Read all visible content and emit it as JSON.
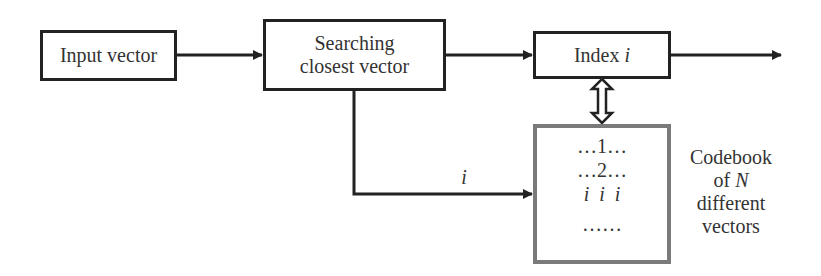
{
  "diagram": {
    "nodes": {
      "input": {
        "label": "Input vector"
      },
      "search": {
        "line1": "Searching",
        "line2": "closest vector"
      },
      "index": {
        "label": "Index",
        "var": "i"
      },
      "codebook": {
        "rows": [
          "…1…",
          "…2…",
          "i  i  i",
          "……"
        ]
      }
    },
    "labels": {
      "edge_i": "i",
      "codebook_caption": {
        "line1": "Codebook",
        "line2_prefix": "of ",
        "line2_var": "N",
        "line3": "different",
        "line4": "vectors"
      }
    },
    "edges": [
      {
        "from": "input",
        "to": "search"
      },
      {
        "from": "search",
        "to": "index"
      },
      {
        "from": "index",
        "to": "output"
      },
      {
        "from": "search",
        "to": "codebook",
        "label": "i"
      },
      {
        "from": "index",
        "to": "codebook",
        "type": "bidirectional"
      }
    ],
    "colors": {
      "stroke": "#222222",
      "codebook_border": "#7a7a7a"
    }
  }
}
